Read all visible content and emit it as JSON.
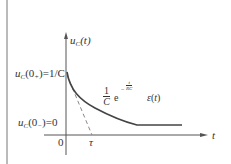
{
  "diagram": {
    "y_axis_label": {
      "main": "u",
      "sub": "C",
      "arg": "(t)"
    },
    "x_axis_label": "t",
    "origin_label": "0",
    "tau_label": "τ",
    "initial_plus": {
      "main": "u",
      "sub": "C",
      "arg": "(0",
      "argsub": "+",
      "rest": ")=1/C"
    },
    "initial_minus": {
      "main": "u",
      "sub": "C",
      "arg": "(0",
      "argsub": "−",
      "rest": ")=0"
    },
    "curve_formula": {
      "frac_num": "1",
      "frac_den": "C",
      "base": "e",
      "exp": "− t/RC",
      "exp_num": "t",
      "exp_den": "RC",
      "step": "ε(t)"
    }
  },
  "colors": {
    "axis": "#555555",
    "curve": "#444444",
    "dashed": "#888888",
    "text": "#333333",
    "border": "#777777"
  }
}
